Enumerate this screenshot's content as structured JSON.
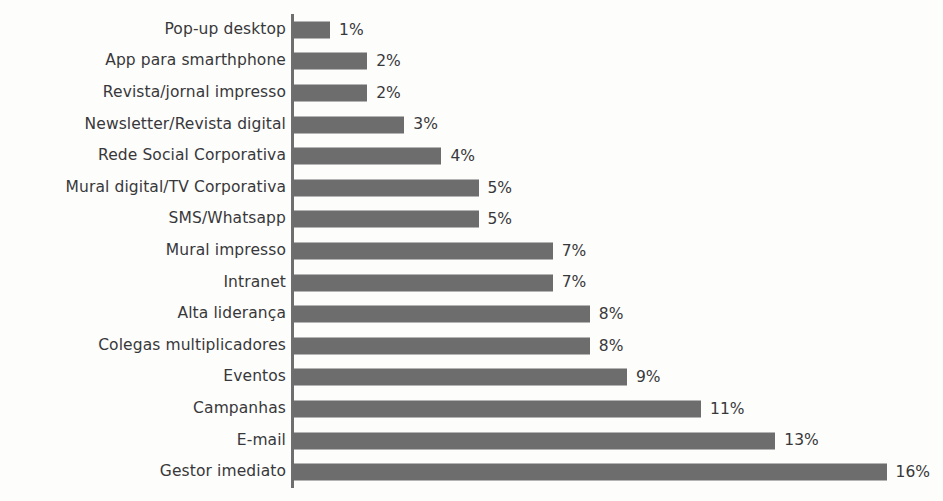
{
  "chart_data": {
    "type": "bar",
    "orientation": "horizontal",
    "title": "",
    "subtitle": "",
    "xlabel": "",
    "ylabel": "",
    "grid": false,
    "legend": null,
    "xlim": [
      0,
      16
    ],
    "value_suffix": "%",
    "categories": [
      "Pop-up desktop",
      "App para smarthphone",
      "Revista/jornal impresso",
      "Newsletter/Revista digital",
      "Rede Social Corporativa",
      "Mural digital/TV Corporativa",
      "SMS/Whatsapp",
      "Mural impresso",
      "Intranet",
      "Alta liderança",
      "Colegas multiplicadores",
      "Eventos",
      "Campanhas",
      "E-mail",
      "Gestor imediato"
    ],
    "values": [
      1,
      2,
      2,
      3,
      4,
      5,
      5,
      7,
      7,
      8,
      8,
      9,
      11,
      13,
      16
    ],
    "value_labels": [
      "1%",
      "2%",
      "2%",
      "3%",
      "4%",
      "5%",
      "5%",
      "7%",
      "7%",
      "8%",
      "8%",
      "9%",
      "11%",
      "13%",
      "16%"
    ],
    "bar_color": "#6d6d6d",
    "text_color": "#38383a",
    "axis_color": "#6f6f6f",
    "background_color": "#fdfdfc"
  }
}
